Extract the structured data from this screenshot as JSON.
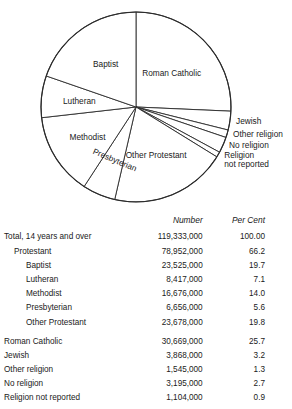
{
  "chart_data": {
    "type": "pie",
    "title": "",
    "center": {
      "x": 136,
      "y": 107
    },
    "radius": 95,
    "start_angle_deg": 0,
    "direction": "clockwise",
    "legend": "none",
    "categories": [
      "Roman Catholic",
      "Jewish",
      "Other religion",
      "No religion",
      "Religion not reported",
      "Other Protestant",
      "Presbyterian",
      "Methodist",
      "Lutheran",
      "Baptist"
    ],
    "values": [
      25.7,
      3.2,
      1.3,
      2.7,
      0.9,
      19.8,
      5.6,
      14.0,
      7.1,
      19.7
    ],
    "value_unit": "percent",
    "counts": [
      30669000,
      3868000,
      1545000,
      3195000,
      1104000,
      23678000,
      6656000,
      16676000,
      8417000,
      23525000
    ],
    "slices": [
      {
        "label": "Roman Catholic",
        "percent": 25.7,
        "number": "30,669,000",
        "label_placement": "inside"
      },
      {
        "label": "Jewish",
        "percent": 3.2,
        "number": "3,868,000",
        "label_placement": "outside"
      },
      {
        "label": "Other religion",
        "percent": 1.3,
        "number": "1,545,000",
        "label_placement": "outside"
      },
      {
        "label": "No religion",
        "percent": 2.7,
        "number": "3,195,000",
        "label_placement": "outside"
      },
      {
        "label": "Religion",
        "label2": "not reported",
        "percent": 0.9,
        "number": "1,104,000",
        "label_placement": "outside"
      },
      {
        "label": "Other Protestant",
        "percent": 19.8,
        "number": "23,678,000",
        "label_placement": "inside"
      },
      {
        "label": "Presbyterian",
        "percent": 5.6,
        "number": "6,656,000",
        "label_placement": "rotated"
      },
      {
        "label": "Methodist",
        "percent": 14.0,
        "number": "16,676,000",
        "label_placement": "inside"
      },
      {
        "label": "Lutheran",
        "percent": 7.1,
        "number": "8,417,000",
        "label_placement": "inside"
      },
      {
        "label": "Baptist",
        "percent": 19.7,
        "number": "23,525,000",
        "label_placement": "inside"
      }
    ]
  },
  "pie_labels": {
    "roman_catholic": "Roman Catholic",
    "jewish": "Jewish",
    "other_religion": "Other religion",
    "no_religion": "No religion",
    "religion_not_reported_line1": "Religion",
    "religion_not_reported_line2": "not reported",
    "other_protestant": "Other Protestant",
    "presbyterian": "Presbyterian",
    "methodist": "Methodist",
    "lutheran": "Lutheran",
    "baptist": "Baptist"
  },
  "table": {
    "headers": {
      "label": "",
      "number": "Number",
      "per_cent": "Per Cent"
    },
    "rows": [
      {
        "label": "Total, 14 years and over",
        "indent": 0,
        "number": "119,333,000",
        "per_cent": "100.00",
        "gap_before": false
      },
      {
        "label": "Protestant",
        "indent": 1,
        "number": "78,952,000",
        "per_cent": "66.2",
        "gap_before": false
      },
      {
        "label": "Baptist",
        "indent": 2,
        "number": "23,525,000",
        "per_cent": "19.7",
        "gap_before": false
      },
      {
        "label": "Lutheran",
        "indent": 2,
        "number": "8,417,000",
        "per_cent": "7.1",
        "gap_before": false
      },
      {
        "label": "Methodist",
        "indent": 2,
        "number": "16,676,000",
        "per_cent": "14.0",
        "gap_before": false
      },
      {
        "label": "Presbyterian",
        "indent": 2,
        "number": "6,656,000",
        "per_cent": "5.6",
        "gap_before": false
      },
      {
        "label": "Other Protestant",
        "indent": 2,
        "number": "23,678,000",
        "per_cent": "19.8",
        "gap_before": false
      },
      {
        "label": "Roman Catholic",
        "indent": 0,
        "number": "30,669,000",
        "per_cent": "25.7",
        "gap_before": true
      },
      {
        "label": "Jewish",
        "indent": 0,
        "number": "3,868,000",
        "per_cent": "3.2",
        "gap_before": false
      },
      {
        "label": "Other religion",
        "indent": 0,
        "number": "1,545,000",
        "per_cent": "1.3",
        "gap_before": false
      },
      {
        "label": "No religion",
        "indent": 0,
        "number": "3,195,000",
        "per_cent": "2.7",
        "gap_before": false
      },
      {
        "label": "Religion not reported",
        "indent": 0,
        "number": "1,104,000",
        "per_cent": "0.9",
        "gap_before": false
      }
    ]
  }
}
